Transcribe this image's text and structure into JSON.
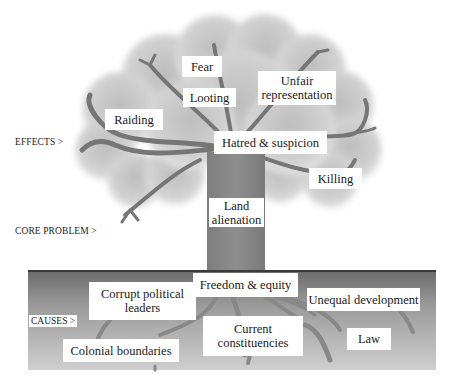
{
  "diagram": {
    "type": "problem-tree",
    "sections": {
      "effects": {
        "label": "EFFECTS >",
        "items": [
          {
            "id": "fear",
            "text": "Fear"
          },
          {
            "id": "looting",
            "text": "Looting"
          },
          {
            "id": "unfair_representation",
            "lines": [
              "Unfair",
              "representation"
            ]
          },
          {
            "id": "raiding",
            "text": "Raiding"
          },
          {
            "id": "hatred_suspicion",
            "text": "Hatred & suspicion"
          },
          {
            "id": "killing",
            "text": "Killing"
          }
        ]
      },
      "core_problem": {
        "label": "CORE PROBLEM >",
        "item": {
          "id": "land_alienation",
          "lines": [
            "Land",
            "alienation"
          ]
        }
      },
      "causes": {
        "label": "CAUSES >",
        "items": [
          {
            "id": "freedom_equity",
            "text": "Freedom & equity"
          },
          {
            "id": "corrupt_leaders",
            "lines": [
              "Corrupt political",
              "leaders"
            ]
          },
          {
            "id": "unequal_development",
            "text": "Unequal development"
          },
          {
            "id": "current_constituencies",
            "lines": [
              "Current",
              "constituencies"
            ]
          },
          {
            "id": "law",
            "text": "Law"
          },
          {
            "id": "colonial_boundaries",
            "text": "Colonial boundaries"
          }
        ]
      }
    },
    "colors": {
      "canopy": "#d4d4d4",
      "canopy_edge": "#e6e6e6",
      "branch": "#7a7a7a",
      "trunk": "#8a8a8a",
      "ground_top": "#6e6e6e",
      "ground_bottom": "#c8c8c8",
      "root": "#8c8c8c",
      "box_bg": "#ffffff"
    }
  }
}
